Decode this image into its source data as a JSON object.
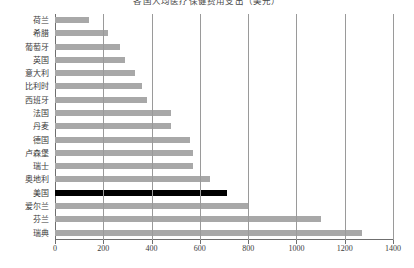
{
  "chart_data": {
    "type": "bar",
    "orientation": "horizontal",
    "title": "各国人均医疗保健费用支出（美元）",
    "xlabel": "",
    "ylabel": "",
    "xlim": [
      0,
      1400
    ],
    "xticks": [
      0,
      200,
      400,
      600,
      800,
      1000,
      1200,
      1400
    ],
    "grid": true,
    "legend": false,
    "highlight_category": "美国",
    "colors": {
      "bar": "#a8a8a8",
      "highlight_bar": "#000000",
      "gridline": "#9a9a9a",
      "axis": "#6f6f6f",
      "text": "#3b3b3b",
      "background": "#ffffff"
    },
    "categories": [
      "荷兰",
      "希腊",
      "葡萄牙",
      "英国",
      "意大利",
      "比利时",
      "西班牙",
      "法国",
      "丹麦",
      "德国",
      "卢森堡",
      "瑞士",
      "奥地利",
      "美国",
      "爱尔兰",
      "芬兰",
      "瑞典"
    ],
    "values": [
      140,
      220,
      270,
      290,
      330,
      360,
      380,
      480,
      480,
      560,
      570,
      570,
      640,
      712,
      800,
      1100,
      1270
    ]
  }
}
